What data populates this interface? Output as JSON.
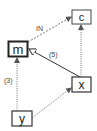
{
  "diagram": {
    "nodes": [
      {
        "id": "c",
        "label": "c",
        "x": 72,
        "y": 10,
        "w": 19,
        "h": 14,
        "border": "thin"
      },
      {
        "id": "m",
        "label": "m",
        "x": 8,
        "y": 41,
        "w": 20,
        "h": 16,
        "border": "bold"
      },
      {
        "id": "x",
        "label": "x",
        "x": 72,
        "y": 77,
        "w": 19,
        "h": 15,
        "border": "thin"
      },
      {
        "id": "y",
        "label": "y",
        "x": 12,
        "y": 111,
        "w": 20,
        "h": 15,
        "border": "thin"
      }
    ],
    "edges": [
      {
        "from": "m",
        "to": "c",
        "style": "dashed",
        "head": "arrow",
        "label": "IN"
      },
      {
        "from": "x",
        "to": "m",
        "style": "solid",
        "head": "hollow-triangle",
        "label": "(5)"
      },
      {
        "from": "y",
        "to": "m",
        "style": "dotted",
        "head": "arrow",
        "label": "(3)"
      },
      {
        "from": "y",
        "to": "x",
        "style": "dotted",
        "head": "arrow",
        "label": ""
      },
      {
        "from": "x",
        "to": "c",
        "style": "dotted",
        "head": "arrow",
        "label": ""
      }
    ],
    "colors": {
      "stroke": "#333333",
      "edge": "#555555",
      "background": "#ffffff"
    }
  }
}
